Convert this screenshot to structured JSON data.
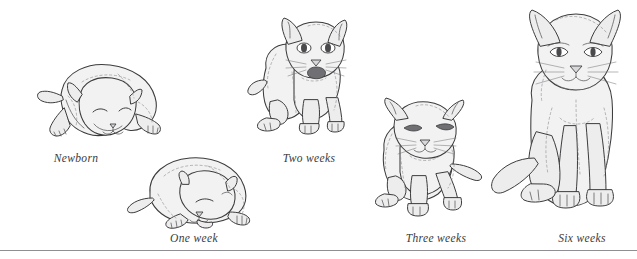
{
  "illustration": {
    "title": "Kitten development stages",
    "medium": "pen-and-ink line drawing",
    "background_color": "#ffffff",
    "outline_color": "#3c3c3e",
    "fill_color": "#f2f2f2",
    "rule_color": "#8e8e93"
  },
  "stages": [
    {
      "id": "newborn",
      "caption": "Newborn",
      "pose": "sprawled lying flat, eyes closed, ears folded flat, head down on forelegs",
      "eyes": "closed",
      "ears": "folded flat",
      "tail": "short, extending left",
      "relative_size": "smallest"
    },
    {
      "id": "one-week",
      "caption": "One week",
      "pose": "curled up sleeping, eyes closed, head resting on front paws",
      "eyes": "closed",
      "ears": "small, low and rounded",
      "tail": "short, curving left",
      "relative_size": "small"
    },
    {
      "id": "two-weeks",
      "caption": "Two weeks",
      "pose": "standing on all fours facing forward, head raised, mouth open",
      "eyes": "open",
      "ears": "upright, triangular",
      "tail": "short, to the left",
      "relative_size": "medium"
    },
    {
      "id": "three-weeks",
      "caption": "Three weeks",
      "pose": "crouching forward, head lowered, front legs braced",
      "eyes": "open, narrowed",
      "ears": "upright, wide-set",
      "tail": "extending to the right",
      "relative_size": "medium-large"
    },
    {
      "id": "six-weeks",
      "caption": "Six weeks",
      "pose": "sitting upright, facing forward, forelegs straight",
      "eyes": "open, almond shaped",
      "ears": "tall and upright",
      "tail": "long, curving to the left along the ground",
      "relative_size": "largest"
    }
  ]
}
